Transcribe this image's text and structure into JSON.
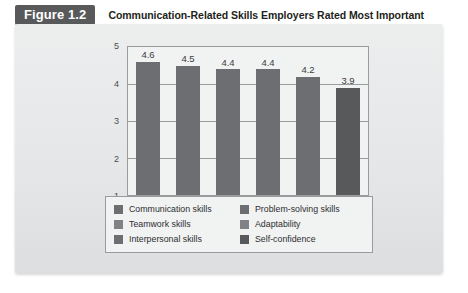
{
  "figure": {
    "number_label": "Figure 1.2",
    "title": "Communication-Related Skills Employers Rated Most Important"
  },
  "chart_data": {
    "type": "bar",
    "title": "Communication-Related Skills Employers Rated Most Important",
    "xlabel": "",
    "ylabel": "",
    "ylim": [
      1,
      5
    ],
    "yticks": [
      "1",
      "2",
      "3",
      "4",
      "5"
    ],
    "grid": true,
    "legend_position": "bottom",
    "categories": [
      "Communication skills",
      "Teamwork skills",
      "Interpersonal skills",
      "Problem-solving skills",
      "Adaptability",
      "Self-confidence"
    ],
    "values": [
      4.6,
      4.5,
      4.4,
      4.4,
      4.2,
      3.9
    ],
    "value_labels": [
      "4.6",
      "4.5",
      "4.4",
      "4.4",
      "4.2",
      "3.9"
    ],
    "bar_colors": [
      "#6d6e71",
      "#6d6e71",
      "#6d6e71",
      "#6d6e71",
      "#6d6e71",
      "#58595b"
    ]
  },
  "legend": {
    "left_column": [
      {
        "label": "Communication skills",
        "color": "#6d6e71"
      },
      {
        "label": "Teamwork skills",
        "color": "#808285"
      },
      {
        "label": "Interpersonal skills",
        "color": "#6d6e71"
      }
    ],
    "right_column": [
      {
        "label": "Problem-solving skills",
        "color": "#6d6e71"
      },
      {
        "label": "Adaptability",
        "color": "#808285"
      },
      {
        "label": "Self-confidence",
        "color": "#58595b"
      }
    ]
  },
  "colors": {
    "badge_background": "#58595b",
    "badge_text": "#ffffff",
    "card_background": "#e9eaec",
    "plot_background": "#f1f2f2",
    "axis_line": "#9a9b9d",
    "title_text": "#231f20"
  }
}
